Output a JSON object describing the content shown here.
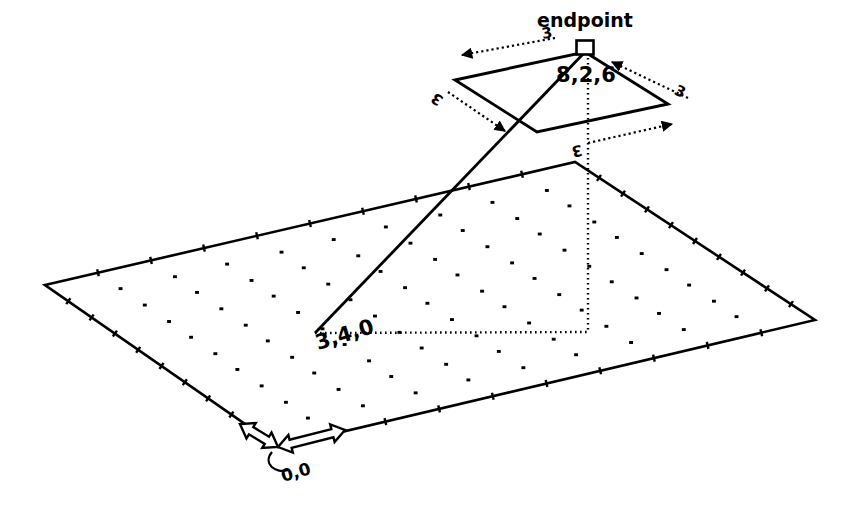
{
  "figure": {
    "title_label": "endpoint",
    "endpoint_coordinate": "8,2,6",
    "ground_coordinate": "3,4,0",
    "origin_coordinate": "0,0",
    "dimension_labels": {
      "top_left": "3",
      "left": "3",
      "right": "3",
      "bottom": "3"
    },
    "colors": {
      "ink": "#000000",
      "paper": "#ffffff"
    },
    "geometry": {
      "ground_plane": {
        "name": "ground-grid-plane",
        "corners": [
          [
            45,
            285
          ],
          [
            575,
            162
          ],
          [
            815,
            320
          ],
          [
            278,
            447
          ]
        ],
        "edge_ticks_per_side": 10,
        "grid_cols": 9,
        "grid_rows": 9
      },
      "upper_quad": {
        "name": "target-region-quad",
        "corners": [
          [
            585,
            52
          ],
          [
            668,
            104
          ],
          [
            537,
            132
          ],
          [
            455,
            80
          ]
        ]
      },
      "endpoint_marker": {
        "name": "endpoint-square-marker",
        "x": 585,
        "y": 52,
        "size": 17
      },
      "ray_from_endpoint": {
        "name": "endpoint-to-ground-ray",
        "from": [
          585,
          52
        ],
        "to": [
          315,
          333
        ]
      },
      "vertical_drop": {
        "name": "endpoint-vertical-dropline",
        "from": [
          588,
          58
        ],
        "to": [
          588,
          332
        ]
      },
      "ground_connector": {
        "name": "ground-projection-dotline",
        "from": [
          315,
          333
        ],
        "to": [
          588,
          332
        ]
      },
      "origin_axes": {
        "name": "origin-axis-arrows",
        "vertex": [
          278,
          447
        ],
        "arrow_a_tip": [
          240,
          424
        ],
        "arrow_b_tip": [
          345,
          430
        ]
      },
      "origin_leader": {
        "name": "origin-leader-curve",
        "from": [
          272,
          452
        ],
        "to": [
          288,
          470
        ]
      },
      "dimension_arrows": [
        {
          "name": "dim-arrow-top-left",
          "from": [
            555,
            38
          ],
          "to": [
            462,
            55
          ],
          "label": "3",
          "label_x": 548,
          "label_y": 38
        },
        {
          "name": "dim-arrow-left",
          "from": [
            448,
            92
          ],
          "to": [
            505,
            131
          ],
          "label": "3",
          "label_x": 440,
          "label_y": 95
        },
        {
          "name": "dim-arrow-right",
          "from": [
            688,
            98
          ],
          "to": [
            612,
            62
          ],
          "label": "3",
          "label_x": 678,
          "label_y": 96
        },
        {
          "name": "dim-arrow-bottom",
          "from": [
            588,
            143
          ],
          "to": [
            672,
            124
          ],
          "label": "3",
          "label_x": 576,
          "label_y": 146
        }
      ]
    }
  }
}
